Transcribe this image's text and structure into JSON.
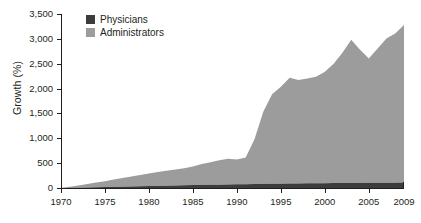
{
  "chart_data": {
    "type": "area",
    "stacked": true,
    "title": "",
    "xlabel": "",
    "ylabel": "Growth (%)",
    "xlim": [
      1970,
      2009
    ],
    "ylim": [
      0,
      3500
    ],
    "grid": false,
    "legend_position": "top-left",
    "xticks": [
      "1970",
      "1975",
      "1980",
      "1985",
      "1990",
      "1995",
      "2000",
      "2005",
      "2009"
    ],
    "xtick_values": [
      1970,
      1975,
      1980,
      1985,
      1990,
      1995,
      2000,
      2005,
      2009
    ],
    "yticks": [
      "0",
      "500",
      "1,000",
      "1,500",
      "2,000",
      "2,500",
      "3,000",
      "3,500"
    ],
    "ytick_values": [
      0,
      500,
      1000,
      1500,
      2000,
      2500,
      3000,
      3500
    ],
    "x": [
      1970,
      1971,
      1972,
      1973,
      1974,
      1975,
      1976,
      1977,
      1978,
      1979,
      1980,
      1981,
      1982,
      1983,
      1984,
      1985,
      1986,
      1987,
      1988,
      1989,
      1990,
      1991,
      1992,
      1993,
      1994,
      1995,
      1996,
      1997,
      1998,
      1999,
      2000,
      2001,
      2002,
      2003,
      2004,
      2005,
      2006,
      2007,
      2008,
      2009
    ],
    "series": [
      {
        "name": "Physicians",
        "color": "#3c3c3c",
        "values": [
          0,
          3,
          6,
          10,
          14,
          18,
          22,
          26,
          30,
          34,
          38,
          42,
          46,
          50,
          54,
          58,
          61,
          64,
          67,
          70,
          73,
          76,
          79,
          82,
          85,
          88,
          90,
          92,
          94,
          96,
          98,
          100,
          101,
          102,
          103,
          104,
          105,
          106,
          108,
          110
        ]
      },
      {
        "name": "Administrators",
        "color": "#9c9c9c",
        "values": [
          0,
          20,
          45,
          70,
          95,
          120,
          150,
          175,
          200,
          225,
          255,
          280,
          300,
          320,
          345,
          375,
          420,
          455,
          490,
          520,
          500,
          540,
          900,
          1450,
          1800,
          1950,
          2130,
          2080,
          2110,
          2140,
          2240,
          2400,
          2620,
          2880,
          2680,
          2500,
          2700,
          2900,
          3000,
          3170
        ]
      }
    ]
  },
  "axis": {
    "ylabel": "Growth (%)"
  },
  "legend": {
    "items": [
      {
        "label": "Physicians",
        "color": "#3c3c3c",
        "swatch_name": "legend-swatch-physicians"
      },
      {
        "label": "Administrators",
        "color": "#9c9c9c",
        "swatch_name": "legend-swatch-administrators"
      }
    ]
  },
  "colors": {
    "background": "#ffffff",
    "axis": "#231f20",
    "physicians": "#3c3c3c",
    "administrators": "#9c9c9c",
    "text": "#231f20"
  }
}
